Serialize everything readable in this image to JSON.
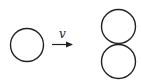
{
  "diagram": {
    "arrow": {
      "label": "v"
    },
    "shapes": {
      "left_circle": {
        "cx": 27,
        "cy": 45,
        "r": 16.5
      },
      "right_top_circle": {
        "cx": 118.5,
        "cy": 26.5,
        "r": 17
      },
      "right_bottom_circle": {
        "cx": 118.5,
        "cy": 61.5,
        "r": 17
      }
    },
    "stroke_color": "#222222"
  }
}
